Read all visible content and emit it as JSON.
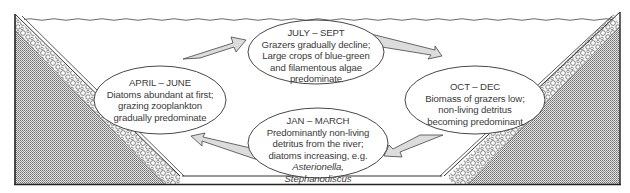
{
  "diagram": {
    "type": "seasonal-cycle",
    "colors": {
      "outline": "#333333",
      "arrow_fill": "#d9d9d9",
      "stipple": "#8a8a8a",
      "text": "#3a3a3a"
    },
    "seasons": [
      {
        "id": "july-sept",
        "heading": "JULY – SEPT",
        "lines": [
          "Grazers gradually decline;",
          "Large crops of blue-green",
          "and filamentous algae",
          "predominate"
        ]
      },
      {
        "id": "oct-dec",
        "heading": "OCT – DEC",
        "lines": [
          "Biomass of grazers low;",
          "non-living detritus",
          "becoming predominant"
        ]
      },
      {
        "id": "jan-march",
        "heading": "JAN – MARCH",
        "lines": [
          "Predominantly non-living",
          "detritus from the river;",
          "diatoms increasing, e.g."
        ],
        "italic_lines": [
          "Asterionella,",
          "Stephanodiscus"
        ]
      },
      {
        "id": "april-june",
        "heading": "APRIL – JUNE",
        "lines": [
          "Diatoms abundant at first;",
          "grazing zooplankton",
          "gradually predominate"
        ]
      }
    ],
    "cycle_arrows": [
      {
        "from": "april-june",
        "to": "july-sept"
      },
      {
        "from": "july-sept",
        "to": "oct-dec"
      },
      {
        "from": "oct-dec",
        "to": "jan-march"
      },
      {
        "from": "jan-march",
        "to": "april-june"
      }
    ]
  }
}
